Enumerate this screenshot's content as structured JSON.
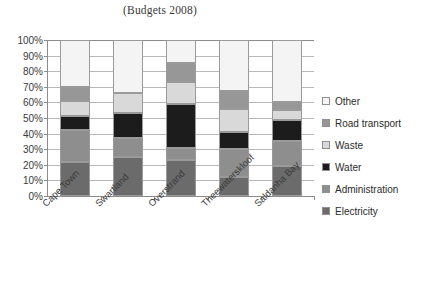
{
  "chart_data": {
    "type": "bar",
    "subtype": "stacked-percent",
    "title": "(Budgets 2008)",
    "xlabel": "",
    "ylabel": "",
    "ylim": [
      0,
      100
    ],
    "y_unit": "%",
    "grid": true,
    "legend_position": "right",
    "legend_order_top_to_bottom": [
      "Other",
      "Road transport",
      "Waste",
      "Water",
      "Administration",
      "Electricity"
    ],
    "categories": [
      "Cape Town",
      "Swartland",
      "Overstrand",
      "Theewaterskloof",
      "Saldanha Bay"
    ],
    "tick_labels": [
      "0%",
      "10%",
      "20%",
      "30%",
      "40%",
      "50%",
      "60%",
      "70%",
      "80%",
      "90%",
      "100%"
    ],
    "tick_values": [
      0,
      10,
      20,
      30,
      40,
      50,
      60,
      70,
      80,
      90,
      100
    ],
    "series": [
      {
        "name": "Electricity",
        "color": "#6b6b6b",
        "values": [
          22,
          25,
          23,
          12,
          19
        ]
      },
      {
        "name": "Administration",
        "color": "#8e8e8e",
        "values": [
          20,
          12,
          8,
          18,
          16
        ]
      },
      {
        "name": "Water",
        "color": "#1c1c1c",
        "values": [
          9,
          16,
          28,
          11,
          14
        ]
      },
      {
        "name": "Waste",
        "color": "#d9d9d9",
        "values": [
          10,
          13,
          14,
          15,
          6
        ]
      },
      {
        "name": "Road transport",
        "color": "#979797",
        "values": [
          9,
          0,
          12,
          11,
          5
        ]
      },
      {
        "name": "Other",
        "color": "#f4f4f4",
        "values": [
          30,
          34,
          15,
          33,
          40
        ]
      }
    ]
  },
  "legend": {
    "items": [
      {
        "label": "Other",
        "color": "#f4f4f4"
      },
      {
        "label": "Road transport",
        "color": "#979797"
      },
      {
        "label": "Waste",
        "color": "#d9d9d9"
      },
      {
        "label": "Water",
        "color": "#1c1c1c"
      },
      {
        "label": "Administration",
        "color": "#8e8e8e"
      },
      {
        "label": "Electricity",
        "color": "#6b6b6b"
      }
    ]
  },
  "colors": {
    "axis": "#8c8c8c",
    "gridline": "#b8b8b8",
    "text": "#2b2b2b",
    "background": "#ffffff"
  }
}
